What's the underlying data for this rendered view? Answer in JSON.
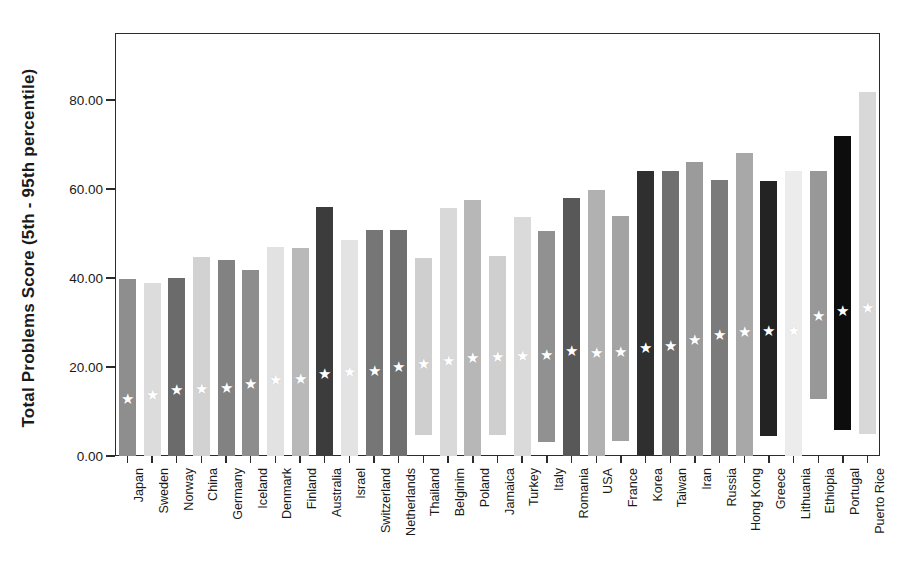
{
  "chart_data": {
    "type": "bar",
    "subtype": "floating-range-bar",
    "title": "",
    "xlabel": "",
    "ylabel": "Total Problems Score (5th - 95th percentile)",
    "ylim": [
      0,
      95
    ],
    "yticks": [
      "0.00",
      "20.00",
      "40.00",
      "60.00",
      "80.00"
    ],
    "ytick_values": [
      0,
      20,
      40,
      60,
      80
    ],
    "grid": false,
    "legend": null,
    "marker": "star",
    "marker_meaning": "mean / median score",
    "categories": [
      "Japan",
      "Sweden",
      "Norway",
      "China",
      "Germany",
      "Iceland",
      "Denmark",
      "Finland",
      "Australia",
      "Israel",
      "Switzerland",
      "Netherlands",
      "Thailand",
      "Belginim",
      "Poland",
      "Jamaica",
      "Turkey",
      "Italy",
      "Romania",
      "USA",
      "France",
      "Korea",
      "Taiwan",
      "Iran",
      "Russia",
      "Hong Kong",
      "Greece",
      "Lithuania",
      "Ethiopia",
      "Portugal",
      "Puerto Rice"
    ],
    "series": [
      {
        "name": "95th percentile (bar top)",
        "values": [
          39.8,
          38.8,
          40.0,
          44.8,
          44.0,
          41.8,
          47.0,
          46.8,
          56.0,
          48.6,
          50.8,
          50.8,
          44.6,
          55.8,
          57.6,
          45.0,
          53.8,
          50.6,
          58.0,
          59.8,
          54.0,
          64.0,
          64.0,
          66.0,
          62.0,
          68.0,
          61.8,
          64.0,
          64.0,
          71.8,
          81.8
        ]
      },
      {
        "name": "5th percentile (bar bottom)",
        "values": [
          0.0,
          0.0,
          0.0,
          0.0,
          0.0,
          0.0,
          0.0,
          0.0,
          0.0,
          0.0,
          0.0,
          0.0,
          4.8,
          0.0,
          0.0,
          4.8,
          0.0,
          3.2,
          0.0,
          0.0,
          3.4,
          0.0,
          0.0,
          0.0,
          0.0,
          0.0,
          4.4,
          0.0,
          12.8,
          5.8,
          5.0
        ]
      },
      {
        "name": "mean (star marker)",
        "values": [
          13.0,
          14.0,
          15.0,
          15.2,
          15.6,
          16.4,
          17.4,
          17.6,
          18.6,
          19.0,
          19.4,
          20.2,
          21.0,
          21.6,
          22.2,
          22.4,
          22.6,
          23.0,
          23.8,
          23.4,
          23.6,
          24.4,
          25.0,
          26.2,
          27.4,
          28.2,
          28.4,
          28.4,
          31.6,
          32.8,
          33.4
        ]
      }
    ],
    "bar_shades": [
      "#8e8e8e",
      "#dcdcdc",
      "#6b6b6b",
      "#d2d2d2",
      "#828282",
      "#8d8d8d",
      "#e2e2e2",
      "#b9b9b9",
      "#3c3c3c",
      "#e3e3e3",
      "#767676",
      "#6f6f6f",
      "#cfcfcf",
      "#d9d9d9",
      "#b7b7b7",
      "#cfcfcf",
      "#dadada",
      "#919191",
      "#585858",
      "#b1b1b1",
      "#a3a3a3",
      "#2f2f2f",
      "#6f6f6f",
      "#9b9b9b",
      "#7b7b7b",
      "#a8a8a8",
      "#232323",
      "#ececec",
      "#989898",
      "#0d0d0d",
      "#d8d8d8"
    ],
    "axis_color": "#2b2b2b",
    "background": "#ffffff"
  }
}
